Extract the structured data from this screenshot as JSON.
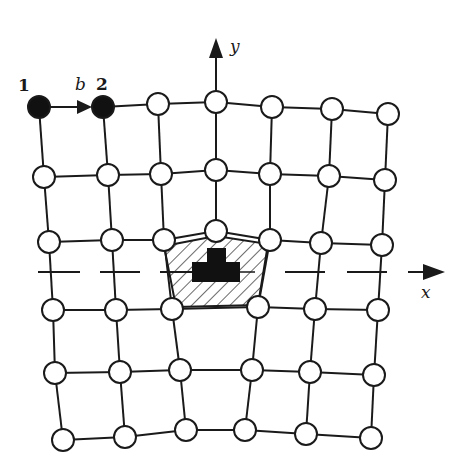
{
  "diagram": {
    "title": "",
    "colors": {
      "line": "#1a1a1a",
      "node_fill": "#ffffff",
      "filled_node": "#111111",
      "core": "#111111",
      "hatch": "#2a2a2a"
    },
    "labels": {
      "node1": "1",
      "node2": "2",
      "burgers": "b",
      "y_axis": "y",
      "x_axis": "x"
    },
    "rows": [
      [
        [
          39,
          107
        ],
        [
          103,
          107
        ],
        [
          158,
          104
        ],
        [
          216,
          102
        ],
        [
          272,
          107
        ],
        [
          332,
          109
        ],
        [
          388,
          114
        ]
      ],
      [
        [
          44,
          177
        ],
        [
          108,
          175
        ],
        [
          161,
          174
        ],
        [
          216,
          170
        ],
        [
          270,
          174
        ],
        [
          329,
          176
        ],
        [
          385,
          180
        ]
      ],
      [
        [
          49,
          242
        ],
        [
          112,
          240
        ],
        [
          164,
          240
        ],
        [
          216,
          231
        ],
        [
          270,
          240
        ],
        [
          321,
          243
        ],
        [
          382,
          245
        ]
      ],
      [
        [
          53,
          310
        ],
        [
          116,
          310
        ],
        [
          172,
          309
        ],
        [
          258,
          307
        ],
        [
          315,
          309
        ],
        [
          378,
          310
        ]
      ],
      [
        [
          55,
          373
        ],
        [
          120,
          372
        ],
        [
          180,
          370
        ],
        [
          252,
          370
        ],
        [
          310,
          372
        ],
        [
          374,
          375
        ]
      ],
      [
        [
          63,
          440
        ],
        [
          125,
          437
        ],
        [
          186,
          430
        ],
        [
          245,
          430
        ],
        [
          306,
          434
        ],
        [
          371,
          438
        ]
      ]
    ],
    "filled_nodes": [
      [
        0,
        0
      ],
      [
        0,
        1
      ]
    ],
    "node_radius": 11,
    "slip_plane": {
      "y": 272,
      "dashes": [
        [
          38,
          80
        ],
        [
          100,
          140
        ],
        [
          160,
          200
        ],
        [
          285,
          325
        ],
        [
          347,
          387
        ]
      ],
      "arrow": {
        "x1": 408,
        "x2": 445
      }
    },
    "y_arrow": {
      "x": 216,
      "y1": 91,
      "y2": 38
    },
    "core_polygon": [
      [
        164,
        246
      ],
      [
        216,
        236
      ],
      [
        268,
        244
      ],
      [
        258,
        305
      ],
      [
        176,
        307
      ]
    ],
    "core_shape": {
      "top": {
        "x": 207,
        "y": 248,
        "w": 19,
        "h": 16
      },
      "bottom": {
        "x": 192,
        "y": 262,
        "w": 48,
        "h": 20
      }
    }
  }
}
